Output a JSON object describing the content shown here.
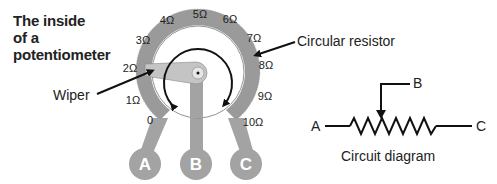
{
  "title": {
    "line1": "The inside",
    "line2": "of a",
    "line3": "potentiometer"
  },
  "labels": {
    "circular_resistor": "Circular resistor",
    "wiper": "Wiper",
    "circuit_diagram": "Circuit diagram"
  },
  "scale": [
    {
      "text": "0",
      "x": 150,
      "y": 120
    },
    {
      "text": "1Ω",
      "x": 133,
      "y": 100
    },
    {
      "text": "2Ω",
      "x": 130,
      "y": 68
    },
    {
      "text": "3Ω",
      "x": 143,
      "y": 40
    },
    {
      "text": "4Ω",
      "x": 167,
      "y": 20
    },
    {
      "text": "5Ω",
      "x": 200,
      "y": 14
    },
    {
      "text": "6Ω",
      "x": 230,
      "y": 19
    },
    {
      "text": "7Ω",
      "x": 254,
      "y": 38
    },
    {
      "text": "8Ω",
      "x": 266,
      "y": 65
    },
    {
      "text": "9Ω",
      "x": 265,
      "y": 96
    },
    {
      "text": "10Ω",
      "x": 253,
      "y": 122
    }
  ],
  "terminals": {
    "a": "A",
    "b": "B",
    "c": "C"
  },
  "circuit": {
    "a": "A",
    "b": "B",
    "c": "C"
  },
  "colors": {
    "ring": "#9a9a9a",
    "terminal": "#a3a3a3",
    "wiper": "#c4c4c4",
    "ink": "#111111"
  }
}
